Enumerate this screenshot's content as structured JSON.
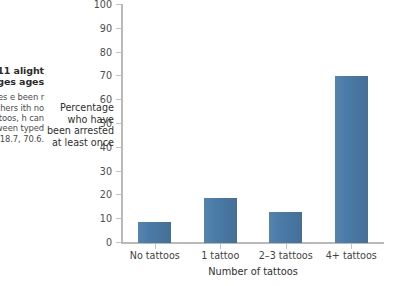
{
  "figure": {
    "caption_heading": "3-11\nalight\nages\nages",
    "caption_body": "ntages\ne been\nr than\nrchers\nith no\nattoos,\nh can\ntween\ntyped\n18.7,\n70.6."
  },
  "chart_data": {
    "type": "bar",
    "title": "",
    "categories": [
      "No tattoos",
      "1 tattoo",
      "2–3 tattoos",
      "4+ tattoos"
    ],
    "values": [
      9,
      19,
      13,
      70
    ],
    "xlabel": "Number of tattoos",
    "ylabel": "Percentage who have been arrested at least once",
    "ylim": [
      0,
      100
    ],
    "ytick_step": 10,
    "yticks": [
      0,
      10,
      20,
      30,
      40,
      50,
      60,
      70,
      80,
      90,
      100
    ],
    "grid": false,
    "legend": false,
    "bar_color": "#4a7ba8",
    "axis_color": "#b9b9b9",
    "background": "#ffffff"
  }
}
